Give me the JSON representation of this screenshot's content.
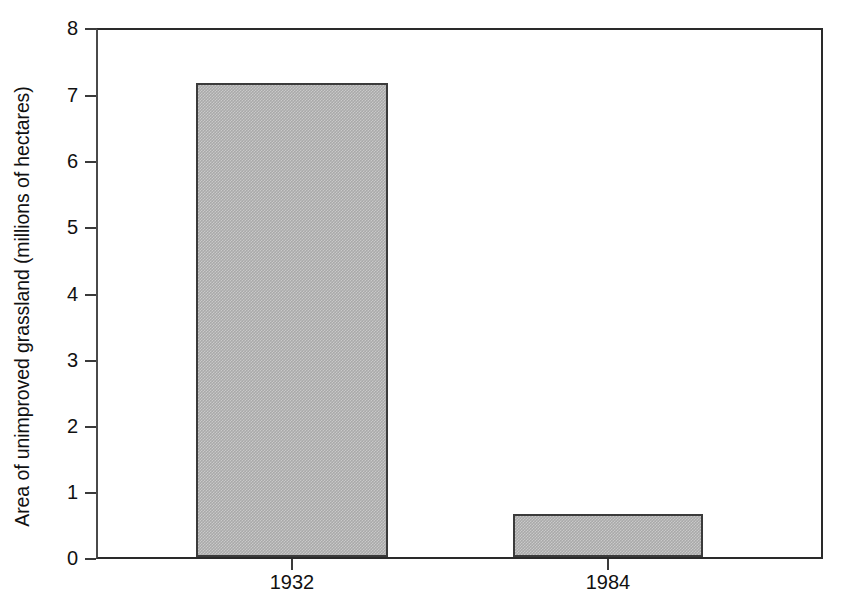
{
  "chart_data": {
    "type": "bar",
    "title": "",
    "xlabel": "",
    "ylabel": "Area of unimproved grassland (millions of hectares)",
    "categories": [
      "1932",
      "1984"
    ],
    "values": [
      7.2,
      0.65
    ],
    "ylim": [
      0,
      8
    ],
    "yticks": [
      "0",
      "1",
      "2",
      "3",
      "4",
      "5",
      "6",
      "7",
      "8"
    ],
    "ytick_values": [
      0,
      1,
      2,
      3,
      4,
      5,
      6,
      7,
      8
    ],
    "grid": false,
    "legend": null,
    "series": [
      {
        "name": "Unimproved grassland area",
        "values": [
          7.2,
          0.65
        ]
      }
    ],
    "bar_fill_color": "#a9a9a9",
    "bar_edge_color": "#3b3b3b",
    "axis_color": "#2a2a2a",
    "background_color": "#ffffff"
  }
}
